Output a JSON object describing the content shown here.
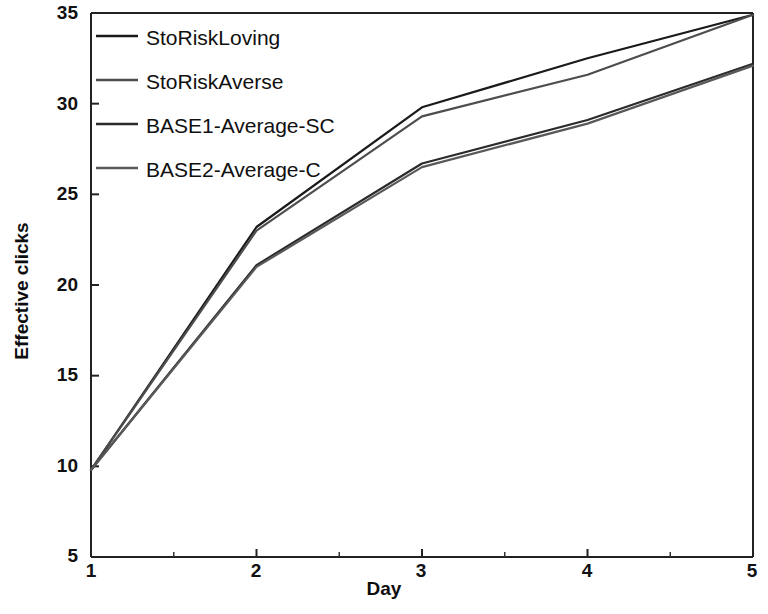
{
  "chart_data": {
    "type": "line",
    "title": "",
    "xlabel": "Day",
    "ylabel": "Effective clicks",
    "xlim": [
      1,
      5
    ],
    "ylim": [
      5,
      35
    ],
    "xticks": [
      1,
      2,
      3,
      4,
      5
    ],
    "yticks": [
      5,
      10,
      15,
      20,
      25,
      30,
      35
    ],
    "xtick_labels": [
      "1",
      "2",
      "3",
      "4",
      "5"
    ],
    "ytick_labels": [
      "5",
      "10",
      "15",
      "20",
      "25",
      "30",
      "35"
    ],
    "minor_xticks": [
      1.5,
      2.5,
      3.5,
      4.5
    ],
    "grid": false,
    "legend_position": "upper left",
    "x": [
      1,
      2,
      3,
      4,
      5
    ],
    "series": [
      {
        "name": "StoRiskLoving",
        "color": "#1a1a1a",
        "values": [
          9.8,
          23.2,
          29.8,
          32.5,
          34.9
        ]
      },
      {
        "name": "StoRiskAverse",
        "color": "#4d4d4d",
        "values": [
          9.8,
          23.0,
          29.3,
          31.6,
          34.9
        ]
      },
      {
        "name": "BASE1-Average-SC",
        "color": "#2b2b2b",
        "values": [
          9.8,
          21.1,
          26.7,
          29.1,
          32.2
        ]
      },
      {
        "name": "BASE2-Average-C",
        "color": "#595959",
        "values": [
          9.8,
          21.0,
          26.5,
          28.9,
          32.1
        ]
      }
    ]
  },
  "legend": {
    "entries": [
      {
        "label": "StoRiskLoving"
      },
      {
        "label": "StoRiskAverse"
      },
      {
        "label": "BASE1-Average-SC"
      },
      {
        "label": "BASE2-Average-C"
      }
    ]
  },
  "axes": {
    "x_label": "Day",
    "y_label": "Effective clicks"
  }
}
